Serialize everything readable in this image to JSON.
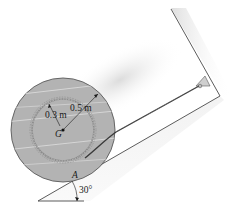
{
  "figure": {
    "type": "engineering-statics-diagram",
    "labels": {
      "outer_radius": "0.5 m",
      "inner_radius": "0.3 m",
      "center": "G",
      "contact_point": "A",
      "incline_angle": "30°"
    },
    "colors": {
      "spool_fill": "#b3b3b3",
      "spool_stroke": "#5a5a5a",
      "wood_grain": "#d9d9d9",
      "surface_line": "#4a4a4a",
      "shadow": "#e0e0e0",
      "cable": "#3a3a3a",
      "text": "#1a1a1a"
    }
  }
}
